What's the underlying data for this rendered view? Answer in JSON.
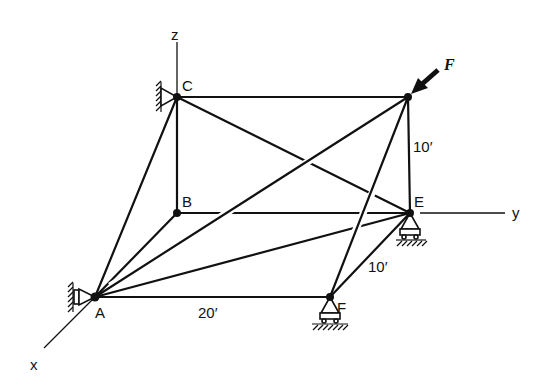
{
  "diagram": {
    "type": "space-truss",
    "axes": [
      {
        "name": "z",
        "label": "z"
      },
      {
        "name": "y",
        "label": "y"
      },
      {
        "name": "x",
        "label": "x"
      }
    ],
    "joints": [
      {
        "id": "A",
        "label": "A",
        "support": "ball-and-socket (wall)"
      },
      {
        "id": "B",
        "label": "B",
        "support": "none"
      },
      {
        "id": "C",
        "label": "C",
        "support": "ball-and-socket (wall)"
      },
      {
        "id": "D",
        "label": "",
        "support": "none",
        "load": "F"
      },
      {
        "id": "E",
        "label": "E",
        "support": "roller (ground)"
      },
      {
        "id": "F",
        "label": "F",
        "support": "roller (ground)"
      }
    ],
    "members": [
      [
        "C",
        "D"
      ],
      [
        "C",
        "B"
      ],
      [
        "C",
        "A"
      ],
      [
        "C",
        "E"
      ],
      [
        "B",
        "E"
      ],
      [
        "B",
        "A"
      ],
      [
        "A",
        "D"
      ],
      [
        "A",
        "E"
      ],
      [
        "A",
        "F"
      ],
      [
        "D",
        "E"
      ],
      [
        "D",
        "F"
      ],
      [
        "E",
        "F"
      ]
    ],
    "load": {
      "label": "F",
      "at": "D"
    },
    "dimensions": [
      {
        "label": "20′",
        "between": "A-F"
      },
      {
        "label": "10′",
        "between": "E-F"
      },
      {
        "label": "10′",
        "between": "D-E"
      }
    ]
  }
}
